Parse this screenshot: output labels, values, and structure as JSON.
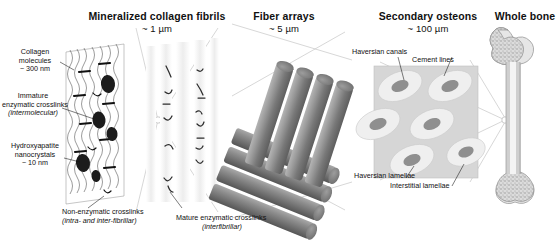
{
  "figure": {
    "type": "scientific-schematic"
  },
  "panels": [
    {
      "id": "mineralized-collagen-fibrils",
      "title": "Mineralized collagen fibrils",
      "scale": "~ 1 µm",
      "labels": [
        {
          "id": "collagen-molecules",
          "line1": "Collagen",
          "line2": "molecules",
          "line3": "~ 300 nm"
        },
        {
          "id": "immature-enzymatic-crosslinks",
          "line1": "Immature",
          "line2": "enzymatic crosslinks",
          "line3": "(intermolecular)"
        },
        {
          "id": "hydroxyapatite-nanocrystals",
          "line1": "Hydroxyapatite",
          "line2": "nanocrystals",
          "line3": "~ 10 nm"
        },
        {
          "id": "non-enzymatic-crosslinks",
          "line1": "Non-enzymatic crosslinks",
          "line2": "(intra- and inter-fibrillar)"
        },
        {
          "id": "mature-enzymatic-crosslinks",
          "line1": "Mature enzymatic crosslinks",
          "line2": "(interfibrillar)"
        }
      ]
    },
    {
      "id": "fiber-arrays",
      "title": "Fiber arrays",
      "scale": "~ 5 µm",
      "labels": []
    },
    {
      "id": "secondary-osteons",
      "title": "Secondary osteons",
      "scale": "~ 100 µm",
      "labels": [
        {
          "id": "haversian-canals",
          "line1": "Haversian canals"
        },
        {
          "id": "cement-lines",
          "line1": "Cement lines"
        },
        {
          "id": "haversian-lamellae",
          "line1": "Haversian lamellae"
        },
        {
          "id": "interstitial-lamellae",
          "line1": "Interstitial lamellae"
        }
      ]
    },
    {
      "id": "whole-bone",
      "title": "Whole bone",
      "scale": "",
      "labels": []
    }
  ],
  "colors": {
    "background": "#ffffff",
    "text": "#111111",
    "connector": "#c6c6c6",
    "fiber_gray": "#8a8a8a",
    "fiber_gray_dark": "#6a6a6a",
    "osteon_bg": "#d8d8d8",
    "osteon_ring": "#efefef",
    "osteon_core": "#9a9a9a",
    "bone_fill": "#e2e2e2",
    "bone_marrow": "#f2f2f2"
  }
}
